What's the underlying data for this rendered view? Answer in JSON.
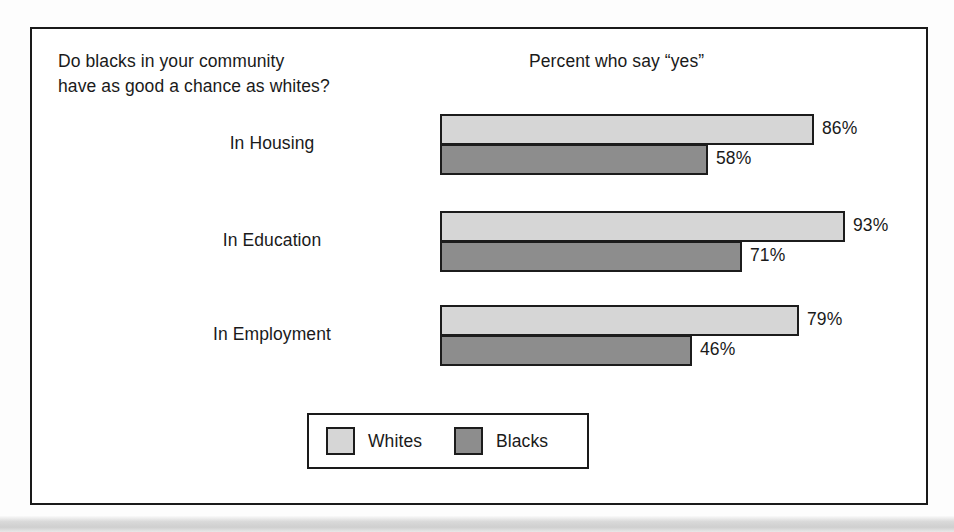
{
  "header": {
    "question": "Do blacks in your community\nhave as good a chance as whites?",
    "percent_header": "Percent who say “yes”"
  },
  "legend": {
    "entries": [
      {
        "label": "Whites",
        "color": "#d6d6d6",
        "swatch_name": "legend-swatch-whites"
      },
      {
        "label": "Blacks",
        "color": "#8d8d8d",
        "swatch_name": "legend-swatch-blacks"
      }
    ]
  },
  "colors": {
    "whites_fill": "#d6d6d6",
    "blacks_fill": "#8d8d8d",
    "outline": "#1c1c1c",
    "frame": "#1a1a1a",
    "background": "#ffffff"
  },
  "chart_data": {
    "type": "bar",
    "orientation": "horizontal",
    "title": "Do blacks in your community have as good a chance as whites?",
    "subtitle": "Percent who say “yes”",
    "xlabel": "",
    "ylabel": "",
    "xlim": [
      0,
      100
    ],
    "grid": false,
    "legend_position": "bottom",
    "categories": [
      "In Housing",
      "In Education",
      "In Employment"
    ],
    "series": [
      {
        "name": "Whites",
        "values": [
          86,
          93,
          79
        ],
        "labels": [
          "86%",
          "93%",
          "79%"
        ],
        "color": "#d6d6d6"
      },
      {
        "name": "Blacks",
        "values": [
          58,
          71,
          46
        ],
        "labels": [
          "58%",
          "71%",
          "46%"
        ],
        "color": "#8d8d8d"
      }
    ]
  },
  "groups": [
    {
      "label": "In Housing",
      "top": 0,
      "whites": {
        "value": 86,
        "label": "86%",
        "width": 374,
        "label_left": 382
      },
      "blacks": {
        "value": 58,
        "label": "58%",
        "width": 268,
        "label_left": 276
      }
    },
    {
      "label": "In Education",
      "top": 97,
      "whites": {
        "value": 93,
        "label": "93%",
        "width": 405,
        "label_left": 413
      },
      "blacks": {
        "value": 71,
        "label": "71%",
        "width": 302,
        "label_left": 310
      }
    },
    {
      "label": "In Employment",
      "top": 191,
      "whites": {
        "value": 79,
        "label": "79%",
        "width": 359,
        "label_left": 367
      },
      "blacks": {
        "value": 46,
        "label": "46%",
        "width": 252,
        "label_left": 260
      }
    }
  ]
}
